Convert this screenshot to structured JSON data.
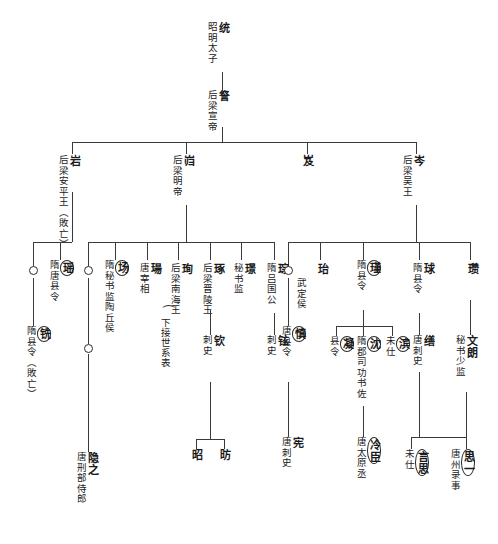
{
  "figure": {
    "type": "genealogy-tree",
    "script": "chinese-vertical",
    "title_present": false
  },
  "glyphs": {
    "empty_circle": "○",
    "brace": "⌣"
  },
  "nodes": {
    "tong": {
      "name": "统",
      "office": "昭明太子"
    },
    "cha": {
      "name": "詧",
      "office": "后梁宣帝"
    },
    "yan": {
      "name": "岩",
      "office": "后梁安平王（敗亡）"
    },
    "kui": {
      "name": "岿",
      "office": "后梁明帝"
    },
    "ji": {
      "name": "岌",
      "office": ""
    },
    "cen": {
      "name": "岑",
      "office": "后梁吴王"
    },
    "circle_a": {
      "name": "○",
      "office": ""
    },
    "yao": {
      "name": "瑶",
      "office": "隋唐县令",
      "circled": true
    },
    "circle_b": {
      "name": "○",
      "office": ""
    },
    "chang": {
      "name": "场",
      "office": "隋秘书监陶丘侯",
      "circled": true
    },
    "chang2": {
      "name": "瑒",
      "office": "唐宰相"
    },
    "xun": {
      "name": "珣",
      "office": "后梁南海王"
    },
    "zhuo": {
      "name": "琢",
      "office": "后梁晋陵王"
    },
    "jing": {
      "name": "璟",
      "office": "秘书监"
    },
    "cong": {
      "name": "琮",
      "office": "隋吕国公"
    },
    "circle_c": {
      "name": "○",
      "office": "武定侯"
    },
    "yi": {
      "name": "珆",
      "office": ""
    },
    "jin": {
      "name": "瑾",
      "office": "隋县令",
      "circled": true
    },
    "qiu": {
      "name": "球",
      "office": "隋县令"
    },
    "zan": {
      "name": "瓒",
      "office": ""
    },
    "xian": {
      "name": "铣",
      "office": "隋县令（敗亡）",
      "circled": true
    },
    "circle_d": {
      "name": "○",
      "office": ""
    },
    "qin": {
      "name": "钦",
      "office": "刺史"
    },
    "xuan": {
      "name": "铉",
      "office": "刺史"
    },
    "shen": {
      "name": "慎",
      "office": "唐县令",
      "circled": true
    },
    "ning": {
      "name": "凝",
      "office": "县令",
      "circled": true
    },
    "shen2": {
      "name": "沈",
      "office": "隋郡司功书佐",
      "circled": true
    },
    "bin": {
      "name": "滨",
      "office": "未仕",
      "circled": true
    },
    "shan": {
      "name": "缮",
      "office": "唐刺史"
    },
    "wenlang": {
      "name": "文朗",
      "office": "秘书少监"
    },
    "yinzhi": {
      "name": "隐之",
      "office": "唐刑部侍郎"
    },
    "zhao": {
      "name": "昭",
      "office": ""
    },
    "fang": {
      "name": "昉",
      "office": ""
    },
    "xian2": {
      "name": "宪",
      "office": "唐刺史"
    },
    "lengju": {
      "name": "冷臣",
      "office": "唐太原丞",
      "circled": true
    },
    "yansi": {
      "name": "言思",
      "office": "未仕",
      "circled": true
    },
    "siyi": {
      "name": "思一",
      "office": "唐州录事",
      "circled": true
    }
  },
  "annotations": {
    "xia_jie": "下接世系表"
  },
  "colors": {
    "ink": "#1a1a1a",
    "line": "#3a3a3a",
    "background": "#ffffff"
  }
}
